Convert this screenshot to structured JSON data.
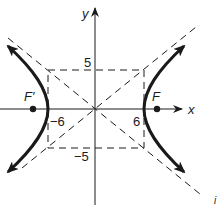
{
  "diagram": {
    "type": "hyperbola",
    "equation": "x^2/36 - y^2/25 = 1",
    "axes": {
      "x_label": "x",
      "y_label": "y"
    },
    "tick_labels": {
      "x_pos": "6",
      "x_neg": "−6",
      "y_pos": "5",
      "y_neg": "−5"
    },
    "foci": {
      "right": "F",
      "left": "F′"
    },
    "corner_mark": "i",
    "colors": {
      "ink": "#1a1a1a",
      "background": "#ffffff"
    }
  }
}
